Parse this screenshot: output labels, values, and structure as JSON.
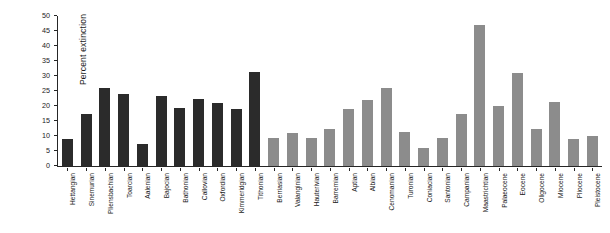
{
  "chart_data": {
    "type": "bar",
    "title": "",
    "subtitle": "",
    "xlabel": "",
    "ylabel": "Percent extinction",
    "ylim": [
      0,
      50
    ],
    "yticks": [
      0,
      5,
      10,
      15,
      20,
      25,
      30,
      35,
      40,
      45,
      50
    ],
    "ytick_labels": [
      "0",
      "5",
      "10",
      "15",
      "20",
      "25",
      "30",
      "35",
      "40",
      "45",
      "50"
    ],
    "grid": false,
    "legend": [],
    "legend_position": "none",
    "bar_colors": {
      "jurassic": "#2b2b2b",
      "cretaceous_and_cenozoic": "#8c8c8c"
    },
    "categories": [
      "Hettangian",
      "Sinemurian",
      "Pliensbachian",
      "Toarcian",
      "Aalenian",
      "Bajocian",
      "Bathonian",
      "Callovian",
      "Oxfordian",
      "Kimmeridgian",
      "Tithonian",
      "Berriasian",
      "Valanginian",
      "Hauterivian",
      "Barremian",
      "Aptian",
      "Albian",
      "Cenomanian",
      "Turonian",
      "Coniacian",
      "Santonian",
      "Campanian",
      "Maastrichtian",
      "Palaeocene",
      "Eocene",
      "Oligocene",
      "Miocene",
      "Pliocene",
      "Pleistocene"
    ],
    "values": [
      9.0,
      17.5,
      26.0,
      24.0,
      7.5,
      23.5,
      19.5,
      22.5,
      21.0,
      19.0,
      31.5,
      9.5,
      11.0,
      9.5,
      12.5,
      19.0,
      22.0,
      26.0,
      11.5,
      6.0,
      9.5,
      17.5,
      47.0,
      20.0,
      31.0,
      12.5,
      21.5,
      9.0,
      10.0
    ],
    "group_of_bar": [
      "jurassic",
      "jurassic",
      "jurassic",
      "jurassic",
      "jurassic",
      "jurassic",
      "jurassic",
      "jurassic",
      "jurassic",
      "jurassic",
      "jurassic",
      "cretaceous_and_cenozoic",
      "cretaceous_and_cenozoic",
      "cretaceous_and_cenozoic",
      "cretaceous_and_cenozoic",
      "cretaceous_and_cenozoic",
      "cretaceous_and_cenozoic",
      "cretaceous_and_cenozoic",
      "cretaceous_and_cenozoic",
      "cretaceous_and_cenozoic",
      "cretaceous_and_cenozoic",
      "cretaceous_and_cenozoic",
      "cretaceous_and_cenozoic",
      "cretaceous_and_cenozoic",
      "cretaceous_and_cenozoic",
      "cretaceous_and_cenozoic",
      "cretaceous_and_cenozoic",
      "cretaceous_and_cenozoic",
      "cretaceous_and_cenozoic"
    ]
  }
}
